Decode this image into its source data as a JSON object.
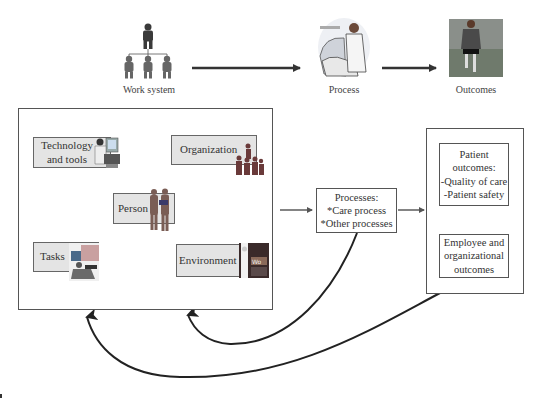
{
  "top_row": {
    "work_system_label": "Work system",
    "process_label": "Process",
    "outcomes_label": "Outcomes",
    "work_system_icon": "org-chart-people-icon",
    "process_icon": "clinician-with-equipment-icon",
    "outcomes_icon": "runner-icon"
  },
  "work_system": {
    "nodes": {
      "technology": {
        "line1": "Technology",
        "line2": "and tools"
      },
      "organization": {
        "label": "Organization"
      },
      "person": {
        "label": "Person"
      },
      "tasks": {
        "label": "Tasks"
      },
      "environment": {
        "label": "Environment"
      }
    }
  },
  "processes_box": {
    "title": "Processes:",
    "item1": "*Care process",
    "item2": "*Other processes"
  },
  "outcomes_box": {
    "patient": {
      "line1": "Patient",
      "line2": "outcomes:",
      "line3": "-Quality of care",
      "line4": "-Patient safety"
    },
    "employee": {
      "line1": "Employee and",
      "line2": "organizational",
      "line3": "outcomes"
    }
  },
  "colors": {
    "node_fill": "#e4e4e4",
    "stroke": "#444444",
    "background": "#ffffff"
  }
}
